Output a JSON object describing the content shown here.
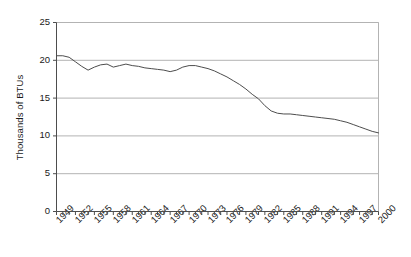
{
  "chart_data": {
    "type": "line",
    "title": "",
    "subtitle": "",
    "xlabel": "",
    "ylabel": "Thousands of BTUs",
    "ylim": [
      0,
      25
    ],
    "xlim": [
      1949,
      2000
    ],
    "yticks": [
      0,
      5,
      10,
      15,
      20,
      25
    ],
    "ytick_labels": [
      "0",
      "5",
      "10",
      "15",
      "20",
      "25"
    ],
    "grid": true,
    "grid_axis": "y",
    "legend": false,
    "legend_position": "none",
    "line_color": "#4d4d4d",
    "axis_color": "#4d4d4d",
    "grid_color": "#b3b3b3",
    "xtick_labels": [
      "1949",
      "1952",
      "1955",
      "1958",
      "1961",
      "1964",
      "1967",
      "1970",
      "1973",
      "1976",
      "1979",
      "1982",
      "1985",
      "1988",
      "1991",
      "1994",
      "1997",
      "2000"
    ],
    "xtick_label_interval": 3,
    "x": [
      1949,
      1950,
      1951,
      1952,
      1953,
      1954,
      1955,
      1956,
      1957,
      1958,
      1959,
      1960,
      1961,
      1962,
      1963,
      1964,
      1965,
      1966,
      1967,
      1968,
      1969,
      1970,
      1971,
      1972,
      1973,
      1974,
      1975,
      1976,
      1977,
      1978,
      1979,
      1980,
      1981,
      1982,
      1983,
      1984,
      1985,
      1986,
      1987,
      1988,
      1989,
      1990,
      1991,
      1992,
      1993,
      1994,
      1995,
      1996,
      1997,
      1998,
      1999,
      2000
    ],
    "series": [
      {
        "name": "Energy use per unit",
        "values": [
          20.6,
          20.6,
          20.4,
          19.8,
          19.2,
          18.7,
          19.1,
          19.4,
          19.5,
          19.1,
          19.3,
          19.5,
          19.3,
          19.2,
          19.0,
          18.9,
          18.8,
          18.7,
          18.5,
          18.7,
          19.1,
          19.3,
          19.3,
          19.1,
          18.9,
          18.6,
          18.2,
          17.8,
          17.3,
          16.8,
          16.2,
          15.5,
          14.9,
          14.0,
          13.3,
          13.0,
          12.9,
          12.9,
          12.8,
          12.7,
          12.6,
          12.5,
          12.4,
          12.3,
          12.2,
          12.0,
          11.8,
          11.5,
          11.2,
          10.9,
          10.6,
          10.4
        ]
      }
    ]
  }
}
